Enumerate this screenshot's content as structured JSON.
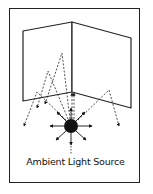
{
  "diagram": {
    "caption": "Ambient Light Source",
    "colors": {
      "stroke": "#222222",
      "source": "#111111",
      "background": "#ffffff"
    },
    "elements": {
      "left_wall": [
        [
          23,
          31
        ],
        [
          72,
          22
        ],
        [
          72,
          92
        ],
        [
          23,
          101
        ]
      ],
      "right_wall": [
        [
          72,
          22
        ],
        [
          131,
          38
        ],
        [
          131,
          108
        ],
        [
          72,
          92
        ]
      ],
      "light_source": {
        "cx": 71,
        "cy": 126,
        "r": 7
      },
      "radial_arrows": 8,
      "reflected_rays": 6
    }
  }
}
